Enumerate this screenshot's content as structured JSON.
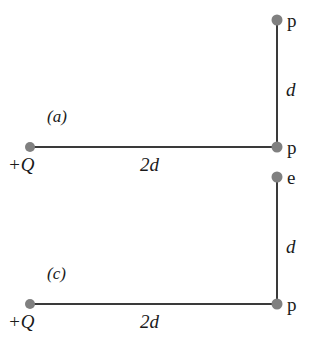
{
  "figure": {
    "background_color": "#ffffff",
    "line_color": "#3a3a3a",
    "dot_color": "#808080",
    "text_color": "#1a1a1a"
  },
  "panels": [
    {
      "key": "a",
      "panel_label": "(a)",
      "source_charge_label": "+Q",
      "horizontal_length_label": "2d",
      "vertical_length_label": "d",
      "corner_point_label": "p",
      "top_point_label": "p",
      "geometry": {
        "origin_dot": {
          "x": 30,
          "y": 147
        },
        "corner_dot": {
          "x": 277,
          "y": 147
        },
        "top_dot": {
          "x": 277,
          "y": 20
        }
      }
    },
    {
      "key": "c",
      "panel_label": "(c)",
      "source_charge_label": "+Q",
      "horizontal_length_label": "2d",
      "vertical_length_label": "d",
      "corner_point_label": "p",
      "top_point_label": "e",
      "geometry": {
        "origin_dot": {
          "x": 30,
          "y": 147
        },
        "corner_dot": {
          "x": 277,
          "y": 147
        },
        "top_dot": {
          "x": 277,
          "y": 20
        }
      }
    }
  ]
}
